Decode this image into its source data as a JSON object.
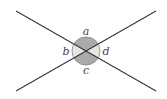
{
  "diagram": {
    "type": "intersecting-lines-angles",
    "labels": {
      "top": "a",
      "left": "b",
      "bottom": "c",
      "right": "d"
    },
    "colors": {
      "line": "#333333",
      "dark_sector": "#aaaaaa",
      "light_sector": "#e6e6e6",
      "circle_outline": "#777777"
    }
  }
}
